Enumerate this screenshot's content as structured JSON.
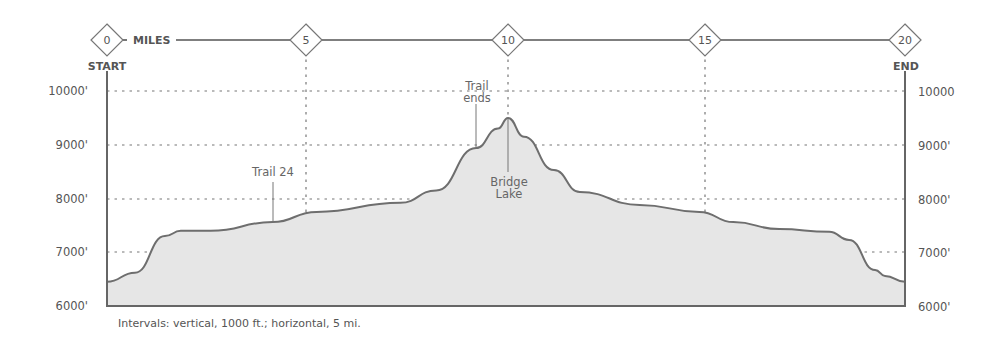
{
  "chart_data": {
    "type": "area",
    "title": "",
    "xlabel": "MILES",
    "ylabel": "",
    "x_ticks": [
      0,
      5,
      10,
      15,
      20
    ],
    "y_ticks": [
      "6000'",
      "7000'",
      "8000'",
      "9000'",
      "10000'"
    ],
    "y_ticks_right": [
      "6000'",
      "7000'",
      "8000'",
      "9000'",
      "10000"
    ],
    "xlim": [
      0,
      20
    ],
    "ylim": [
      6000,
      10000
    ],
    "grid": true,
    "start_label": "START",
    "end_label": "END",
    "x": [
      0,
      0.7,
      1.45,
      1.85,
      2.6,
      4.15,
      5.25,
      7.35,
      8.25,
      9.25,
      9.8,
      10.05,
      10.45,
      11.2,
      11.85,
      13.35,
      14.85,
      15.7,
      16.85,
      18.1,
      18.6,
      19.25,
      19.5,
      20.0
    ],
    "elevation": [
      6450,
      6620,
      7300,
      7400,
      7400,
      7560,
      7750,
      7920,
      8150,
      8940,
      9300,
      9500,
      9150,
      8530,
      8120,
      7880,
      7750,
      7560,
      7430,
      7380,
      7230,
      6670,
      6560,
      6450
    ],
    "annotations": [
      {
        "text": "Trail 24",
        "x": 4.15,
        "elevation": 7560
      },
      {
        "text": "Trail ends",
        "x": 9.4,
        "elevation": 9000
      },
      {
        "text": "Bridge Lake",
        "x": 10.05,
        "elevation": 9500
      }
    ],
    "footnote": "Intervals:  vertical, 1000 ft.; horizontal, 5 mi."
  },
  "labels": {
    "miles": "MILES",
    "start": "START",
    "end": "END",
    "mile_markers": [
      "0",
      "5",
      "10",
      "15",
      "20"
    ],
    "left_ticks": [
      "10000'",
      "9000'",
      "8000'",
      "7000'",
      "6000'"
    ],
    "right_ticks": [
      "10000",
      "9000'",
      "8000'",
      "7000'",
      "6000'"
    ],
    "trail24": "Trail 24",
    "trail_ends_1": "Trail",
    "trail_ends_2": "ends",
    "bridge_1": "Bridge",
    "bridge_2": "Lake",
    "footnote": "Intervals:  vertical, 1000 ft.; horizontal, 5 mi."
  },
  "colors": {
    "fill": "#e6e6e6",
    "line": "#6e6e6e",
    "axis": "#666666",
    "grid": "#777777"
  }
}
